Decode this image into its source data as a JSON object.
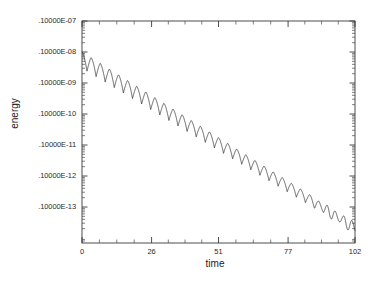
{
  "chart_data": {
    "type": "line",
    "title": "",
    "xlabel": "time",
    "ylabel": "energy",
    "yscale": "log",
    "xscale": "linear",
    "xlim": [
      0,
      102
    ],
    "ylim": [
      1e-14,
      1e-07
    ],
    "grid": false,
    "legend": null,
    "xticks": [
      0,
      26,
      51,
      77,
      102
    ],
    "xticklabels": [
      "0",
      "26",
      "51",
      "77",
      "102"
    ],
    "yticks": [
      1e-07,
      1e-08,
      1e-09,
      1e-10,
      1e-11,
      1e-12,
      1e-13
    ],
    "yticklabels": [
      ".10000E-07",
      ".10000E-08",
      ".10000E-09",
      ".10000E-10",
      ".10000E-11",
      ".10000E-12",
      ".10000E-13"
    ],
    "series": [
      {
        "name": "energy",
        "envelope_start": 1e-08,
        "envelope_end": 3e-14,
        "oscillation_cycles": 30,
        "oscillation_period": 3.4,
        "x": [
          0,
          5,
          10,
          15,
          20,
          26,
          30,
          35,
          40,
          45,
          51,
          55,
          60,
          65,
          70,
          77,
          80,
          85,
          90,
          95,
          100,
          102
        ],
        "y": [
          1e-08,
          5e-09,
          2.5e-09,
          1.25e-09,
          6.3e-10,
          2.5e-10,
          1.6e-10,
          8e-11,
          4e-11,
          2e-11,
          8e-12,
          5e-12,
          2.5e-12,
          1.25e-12,
          6.3e-13,
          2.5e-13,
          1.8e-13,
          1e-13,
          6e-14,
          4e-14,
          3.2e-14,
          3e-14
        ]
      }
    ]
  },
  "axis_titles": {
    "y": "energy",
    "x": "time"
  }
}
